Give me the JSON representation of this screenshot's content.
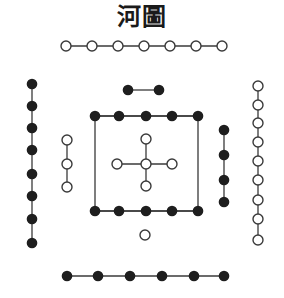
{
  "title": "河圖",
  "colors": {
    "line": "#3a3a3a",
    "black_dot": "#1e1e1e",
    "white_dot_fill": "#ffffff",
    "white_dot_stroke": "#3a3a3a"
  },
  "groups": [
    {
      "name": "top-row",
      "type": "white",
      "count": 7,
      "orientation": "horizontal",
      "points": [
        [
          66,
          46
        ],
        [
          92,
          46
        ],
        [
          118,
          46
        ],
        [
          144,
          46
        ],
        [
          170,
          46
        ],
        [
          196,
          46
        ],
        [
          222,
          46
        ]
      ]
    },
    {
      "name": "left-column",
      "type": "black",
      "count": 8,
      "orientation": "vertical",
      "points": [
        [
          32,
          84
        ],
        [
          32,
          106
        ],
        [
          32,
          128
        ],
        [
          32,
          150
        ],
        [
          32,
          174
        ],
        [
          32,
          196
        ],
        [
          32,
          219
        ],
        [
          32,
          243
        ]
      ]
    },
    {
      "name": "right-column",
      "type": "white",
      "count": 9,
      "orientation": "vertical",
      "points": [
        [
          258,
          86
        ],
        [
          258,
          105
        ],
        [
          258,
          123
        ],
        [
          258,
          142
        ],
        [
          258,
          161
        ],
        [
          258,
          180
        ],
        [
          258,
          200
        ],
        [
          258,
          219
        ],
        [
          258,
          240
        ]
      ]
    },
    {
      "name": "inner-top",
      "type": "black",
      "count": 2,
      "orientation": "horizontal",
      "points": [
        [
          128,
          90
        ],
        [
          159,
          90
        ]
      ]
    },
    {
      "name": "inner-left",
      "type": "white",
      "count": 3,
      "orientation": "vertical",
      "points": [
        [
          67,
          140
        ],
        [
          67,
          164
        ],
        [
          67,
          187
        ]
      ]
    },
    {
      "name": "inner-right",
      "type": "black",
      "count": 4,
      "orientation": "vertical",
      "points": [
        [
          224,
          130
        ],
        [
          224,
          155
        ],
        [
          224,
          180
        ],
        [
          224,
          202
        ]
      ]
    },
    {
      "name": "square-top",
      "type": "black",
      "count": 5,
      "orientation": "horizontal",
      "points": [
        [
          95,
          116
        ],
        [
          119,
          116
        ],
        [
          146,
          116
        ],
        [
          172,
          116
        ],
        [
          198,
          116
        ]
      ]
    },
    {
      "name": "square-bottom",
      "type": "black",
      "count": 5,
      "orientation": "horizontal",
      "points": [
        [
          95,
          211
        ],
        [
          119,
          211
        ],
        [
          146,
          211
        ],
        [
          172,
          211
        ],
        [
          198,
          211
        ]
      ]
    },
    {
      "name": "center-cross",
      "type": "white",
      "count": 5,
      "orientation": "cross",
      "points": [
        [
          146,
          139
        ],
        [
          117,
          164
        ],
        [
          146,
          164
        ],
        [
          172,
          164
        ],
        [
          146,
          186
        ]
      ]
    },
    {
      "name": "inner-bottom",
      "type": "white",
      "count": 1,
      "orientation": "single",
      "points": [
        [
          145,
          235
        ]
      ]
    },
    {
      "name": "bottom-row",
      "type": "black",
      "count": 6,
      "orientation": "horizontal",
      "points": [
        [
          67,
          276
        ],
        [
          98,
          276
        ],
        [
          130,
          276
        ],
        [
          162,
          276
        ],
        [
          194,
          276
        ],
        [
          224,
          276
        ]
      ]
    }
  ],
  "square_frame": {
    "x1": 95,
    "y1": 116,
    "x2": 198,
    "y2": 211
  }
}
